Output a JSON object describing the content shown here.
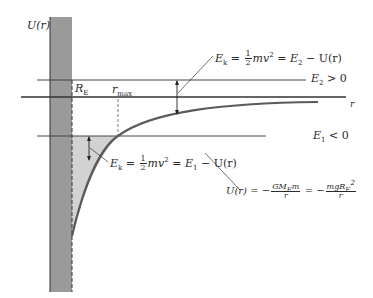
{
  "diagram": {
    "y_axis_label": "U(r)",
    "x_axis_label": "r",
    "earth_radius_label": "R",
    "earth_radius_sub": "E",
    "rmax_label": "r",
    "rmax_sub": "max",
    "E2_label": {
      "base": "E",
      "sub": "2",
      "rest": " > 0"
    },
    "E1_label": {
      "base": "E",
      "sub": "1",
      "rest": " < 0"
    },
    "ek_upper": {
      "lhs": "E",
      "lhs_sub": "k",
      "eq1": " = ",
      "half_num": "1",
      "half_den": "2",
      "mv": "mv",
      "mv_sup": "2",
      "rhs": " = E",
      "rhs_sub": "2",
      "tail": " − U(r)"
    },
    "ek_lower": {
      "lhs": "E",
      "lhs_sub": "k",
      "eq1": " = ",
      "half_num": "1",
      "half_den": "2",
      "mv": "mv",
      "mv_sup": "2",
      "rhs": " = E",
      "rhs_sub": "1",
      "tail": " − U(r)"
    },
    "potential_formula": {
      "lhs": "U(r) = −",
      "f1_num": "GM",
      "f1_num_sub": "E",
      "f1_num_tail": "m",
      "f1_den": "r",
      "mid": " = −",
      "f2_num": "mgR",
      "f2_num_sub": "E",
      "f2_num_sup": "2",
      "f2_den": "r"
    },
    "colors": {
      "wall": "#9a9a9a",
      "shaded_region": "#cfcfcf",
      "line": "#3a3a3a",
      "curve": "#555555"
    }
  }
}
